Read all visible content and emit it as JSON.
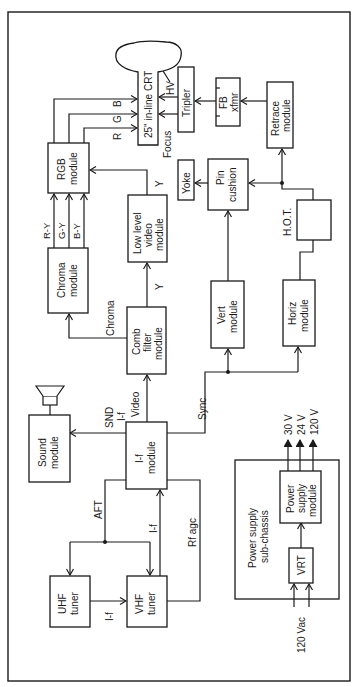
{
  "diagram": {
    "orientation": "rotated-90-clockwise",
    "blocks": {
      "crt": {
        "lines": [
          "25\" in-line CRT"
        ]
      },
      "tripler": {
        "lines": [
          "Tripler"
        ]
      },
      "fb_xfmr": {
        "lines": [
          "FB",
          "xfmr"
        ]
      },
      "retrace": {
        "lines": [
          "Retrace",
          "module"
        ]
      },
      "rgb": {
        "lines": [
          "RGB",
          "module"
        ]
      },
      "yoke": {
        "lines": [
          "Yoke"
        ]
      },
      "pin_cushion": {
        "lines": [
          "Pin",
          "cushion"
        ]
      },
      "hot": {
        "lines": [
          ""
        ]
      },
      "chroma": {
        "lines": [
          "Chroma",
          "module"
        ]
      },
      "low_level_video": {
        "lines": [
          "Low level",
          "video",
          "module"
        ]
      },
      "comb_filter": {
        "lines": [
          "Comb",
          "filter",
          "module"
        ]
      },
      "vert": {
        "lines": [
          "Vert",
          "module"
        ]
      },
      "horiz": {
        "lines": [
          "Horiz",
          "module"
        ]
      },
      "sound": {
        "lines": [
          "Sound",
          "module"
        ]
      },
      "if_module": {
        "lines": [
          "I-f",
          "module"
        ]
      },
      "uhf_tuner": {
        "lines": [
          "UHF",
          "tuner"
        ]
      },
      "vhf_tuner": {
        "lines": [
          "VHF",
          "tuner"
        ]
      },
      "power_subchassis": {
        "lines": [
          "Power supply",
          "sub-chassis"
        ]
      },
      "power_supply": {
        "lines": [
          "Power",
          "supply",
          "module"
        ]
      },
      "vrt": {
        "lines": [
          "VRT"
        ]
      }
    },
    "signal_labels": {
      "r": "R",
      "g": "G",
      "b": "B",
      "hv": "HV",
      "focus": "Focus",
      "r_y": "R-Y",
      "g_y": "G-Y",
      "b_y": "B-Y",
      "y_top": "Y",
      "y_comb": "Y",
      "chroma": "Chroma",
      "hot": "H.O.T.",
      "snd_if_1": "SND",
      "snd_if_2": "I-f",
      "video": "Video",
      "sync": "Sync",
      "aft": "AFT",
      "if_vhf": "I-f",
      "if_uhf": "I-f",
      "rf_agc": "Rf agc",
      "v30": "30 V",
      "v24": "24 V",
      "v120": "120 V",
      "vac": "120 Vac"
    },
    "colors": {
      "ink": "#1a1a1a",
      "background": "#ffffff"
    }
  }
}
